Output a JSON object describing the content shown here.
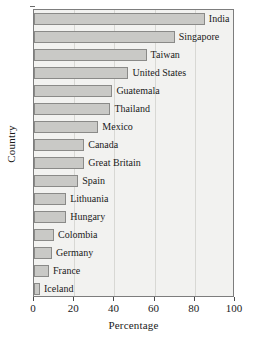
{
  "chart_data": {
    "type": "bar",
    "orientation": "horizontal",
    "title": "",
    "xlabel": "Percentage",
    "ylabel": "Country",
    "xlim": [
      0,
      100
    ],
    "xticks": [
      0,
      20,
      40,
      60,
      80,
      100
    ],
    "xtick_labels": [
      "0",
      "20",
      "40",
      "60",
      "80",
      "100"
    ],
    "grid": true,
    "grid_axis": "x",
    "legend": false,
    "categories": [
      "India",
      "Singapore",
      "Taiwan",
      "United States",
      "Guatemala",
      "Thailand",
      "Mexico",
      "Canada",
      "Great Britain",
      "Spain",
      "Lithuania",
      "Hungary",
      "Colombia",
      "Germany",
      "France",
      "Iceland"
    ],
    "values": [
      85,
      70,
      56,
      47,
      39,
      38,
      32,
      25,
      25,
      22,
      16,
      16,
      10,
      9,
      7.5,
      3
    ],
    "bar_fill_color": "#c9c9c6",
    "bar_edge_color": "#8a8a88",
    "plot_background_color": "#f2f2f0",
    "frame_color": "#7d7d7d"
  }
}
